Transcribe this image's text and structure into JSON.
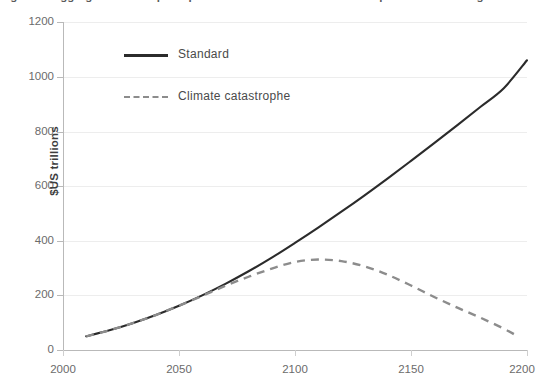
{
  "figure": {
    "caption": "Figure 3: Aggregate consumption paths under standard and catastrophic climate change scenarios"
  },
  "chart_data": {
    "type": "line",
    "title": "",
    "xlabel": "",
    "ylabel": "$US trillions",
    "xlim": [
      2000,
      2200
    ],
    "ylim": [
      0,
      1200
    ],
    "xticks": [
      2000,
      2050,
      2100,
      2150,
      2200
    ],
    "yticks": [
      0,
      200,
      400,
      600,
      800,
      1000,
      1200
    ],
    "grid": "horizontal",
    "legend_position": "upper-left-inside",
    "series": [
      {
        "name": "Standard",
        "style": "solid",
        "color": "#2b2b2b",
        "x": [
          2010,
          2020,
          2030,
          2040,
          2050,
          2060,
          2070,
          2080,
          2090,
          2100,
          2110,
          2120,
          2130,
          2140,
          2150,
          2160,
          2170,
          2180,
          2190,
          2200
        ],
        "values": [
          50,
          72,
          98,
          128,
          162,
          200,
          242,
          288,
          338,
          392,
          448,
          506,
          566,
          628,
          692,
          757,
          823,
          890,
          958,
          1060
        ]
      },
      {
        "name": "Climate catastrophe",
        "style": "dashed",
        "color": "#8c8c8c",
        "x": [
          2010,
          2020,
          2030,
          2040,
          2050,
          2060,
          2070,
          2080,
          2090,
          2100,
          2110,
          2120,
          2130,
          2140,
          2150,
          2160,
          2170,
          2180,
          2190,
          2195
        ],
        "values": [
          50,
          72,
          98,
          128,
          162,
          198,
          235,
          268,
          298,
          322,
          331,
          325,
          306,
          275,
          236,
          194,
          155,
          118,
          78,
          55
        ]
      }
    ]
  },
  "axes": {
    "y_tick_labels": [
      "1200",
      "1000",
      "800",
      "600",
      "400",
      "200",
      "0"
    ],
    "x_tick_labels": [
      "2000",
      "2050",
      "2100",
      "2150",
      "2200"
    ],
    "y_axis_title": "$US trillions"
  },
  "legend": {
    "entries": [
      {
        "label": "Standard",
        "style": "solid"
      },
      {
        "label": "Climate catastrophe",
        "style": "dashed"
      }
    ]
  }
}
